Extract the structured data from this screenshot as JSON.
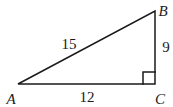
{
  "figure": {
    "type": "right-triangle",
    "background": "#ffffff",
    "stroke_color": "#1a1a1a",
    "text_color": "#1a1a1a",
    "right_angle_at": "C",
    "right_angle_size": 12,
    "vertices": [
      {
        "label": "A",
        "x": 18,
        "y": 84
      },
      {
        "label": "B",
        "x": 155,
        "y": 11
      },
      {
        "label": "C",
        "x": 155,
        "y": 84
      }
    ],
    "sides": [
      {
        "name": "AB",
        "description": "hypotenuse",
        "length_label": "15"
      },
      {
        "name": "AC",
        "description": "base",
        "length_label": "12"
      },
      {
        "name": "BC",
        "description": "height",
        "length_label": "9"
      }
    ]
  }
}
